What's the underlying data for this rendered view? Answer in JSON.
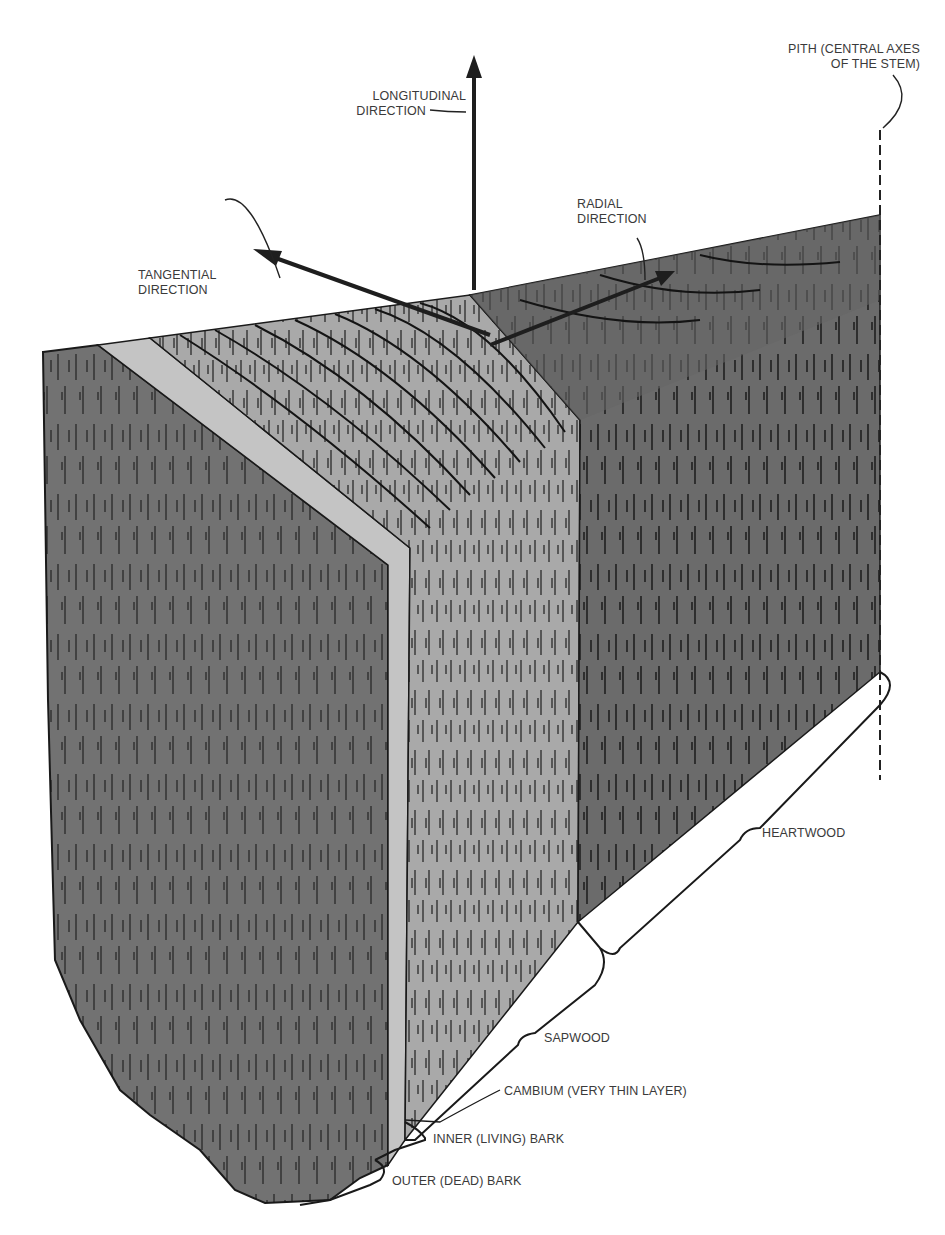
{
  "diagram": {
    "colors": {
      "heartwood": "#6b6b6b",
      "sapwood": "#a9a9a9",
      "sapwood_edge_band": "#c4c4c4",
      "bark_face": "#727272",
      "grain_line": "#111111",
      "label_text": "#3a3a3a",
      "background": "#ffffff"
    },
    "directions": {
      "longitudinal": {
        "line1": "LONGITUDINAL",
        "line2": "DIRECTION"
      },
      "tangential": {
        "line1": "TANGENTIAL",
        "line2": "DIRECTION"
      },
      "radial": {
        "line1": "RADIAL",
        "line2": "DIRECTION"
      }
    },
    "pith": {
      "line1": "PITH (CENTRAL AXES",
      "line2": "OF THE STEM)"
    },
    "layers": [
      {
        "id": "heartwood",
        "label": "HEARTWOOD"
      },
      {
        "id": "sapwood",
        "label": "SAPWOOD"
      },
      {
        "id": "cambium",
        "label": "CAMBIUM (VERY THIN LAYER)"
      },
      {
        "id": "inner_bark",
        "label": "INNER (LIVING) BARK"
      },
      {
        "id": "outer_bark",
        "label": "OUTER (DEAD) BARK"
      }
    ]
  }
}
